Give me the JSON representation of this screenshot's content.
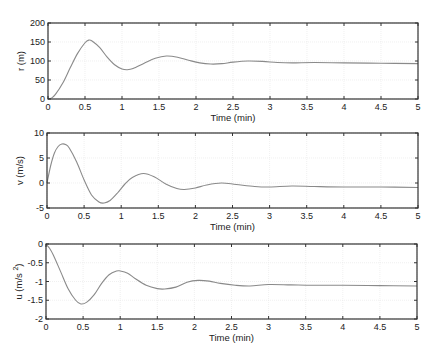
{
  "chart_data": [
    {
      "type": "line",
      "title": "",
      "xlabel": "Time (min)",
      "ylabel": "r (m)",
      "xlim": [
        0,
        5
      ],
      "ylim": [
        0,
        200
      ],
      "xticks": [
        "0",
        "0.5",
        "1",
        "1.5",
        "2",
        "2.5",
        "3",
        "3.5",
        "4",
        "4.5",
        "5"
      ],
      "yticks": [
        "0",
        "50",
        "100",
        "150",
        "200"
      ],
      "grid": true,
      "box": {
        "left": 48,
        "top": 23,
        "right": 418,
        "bottom": 99
      },
      "x": [
        0,
        0.05,
        0.1,
        0.2,
        0.3,
        0.4,
        0.5,
        0.55,
        0.6,
        0.7,
        0.8,
        0.9,
        1.0,
        1.07,
        1.15,
        1.3,
        1.45,
        1.6,
        1.75,
        1.9,
        2.05,
        2.2,
        2.35,
        2.5,
        2.7,
        2.9,
        3.1,
        3.3,
        3.6,
        4.0,
        4.5,
        5.0
      ],
      "series": [
        {
          "name": "r",
          "values": [
            0,
            3,
            12,
            42,
            82,
            120,
            148,
            155,
            152,
            135,
            110,
            90,
            79,
            77,
            80,
            94,
            107,
            113,
            110,
            102,
            95,
            92,
            93,
            97,
            100,
            99,
            96,
            95,
            96,
            95,
            94,
            93
          ]
        }
      ]
    },
    {
      "type": "line",
      "title": "",
      "xlabel": "Time (min)",
      "ylabel": "v (m/s)",
      "xlim": [
        0,
        5
      ],
      "ylim": [
        -5,
        10
      ],
      "xticks": [
        "0",
        "0.5",
        "1",
        "1.5",
        "2",
        "2.5",
        "3",
        "3.5",
        "4",
        "4.5",
        "5"
      ],
      "yticks": [
        "-5",
        "0",
        "5",
        "10"
      ],
      "grid": true,
      "box": {
        "left": 47,
        "top": 133,
        "right": 418,
        "bottom": 208
      },
      "x": [
        0,
        0.05,
        0.1,
        0.15,
        0.2,
        0.25,
        0.3,
        0.4,
        0.5,
        0.6,
        0.7,
        0.77,
        0.85,
        0.95,
        1.05,
        1.15,
        1.3,
        1.45,
        1.6,
        1.75,
        1.85,
        2.0,
        2.15,
        2.35,
        2.55,
        2.8,
        3.0,
        3.3,
        3.6,
        4.0,
        4.5,
        5.0
      ],
      "series": [
        {
          "name": "v",
          "values": [
            0,
            3.5,
            6,
            7.3,
            7.8,
            7.7,
            7.0,
            4.2,
            0.6,
            -2.4,
            -3.8,
            -4.0,
            -3.5,
            -2.0,
            -0.2,
            1.1,
            1.9,
            1.2,
            -0.2,
            -1.1,
            -1.3,
            -1.0,
            -0.4,
            0.0,
            -0.3,
            -0.7,
            -0.8,
            -0.6,
            -0.7,
            -0.8,
            -0.8,
            -0.9
          ]
        }
      ]
    },
    {
      "type": "line",
      "title": "",
      "xlabel": "Time (min)",
      "ylabel": "u (m/s²)",
      "xlim": [
        0,
        5
      ],
      "ylim": [
        -2,
        0
      ],
      "xticks": [
        "0",
        "0.5",
        "1",
        "1.5",
        "2",
        "2.5",
        "3",
        "3.5",
        "4",
        "4.5",
        "5"
      ],
      "yticks": [
        "-2",
        "-1.5",
        "-1",
        "-0.5",
        "0"
      ],
      "grid": true,
      "box": {
        "left": 46,
        "top": 244,
        "right": 417,
        "bottom": 319
      },
      "x": [
        0,
        0.05,
        0.1,
        0.2,
        0.3,
        0.4,
        0.47,
        0.55,
        0.65,
        0.75,
        0.85,
        0.95,
        1.0,
        1.1,
        1.2,
        1.35,
        1.5,
        1.6,
        1.75,
        1.9,
        2.05,
        2.2,
        2.35,
        2.55,
        2.75,
        3.0,
        3.3,
        3.6,
        4.0,
        4.5,
        5.0
      ],
      "series": [
        {
          "name": "u",
          "values": [
            0,
            -0.12,
            -0.3,
            -0.75,
            -1.2,
            -1.5,
            -1.6,
            -1.55,
            -1.35,
            -1.05,
            -0.82,
            -0.72,
            -0.72,
            -0.78,
            -0.92,
            -1.1,
            -1.19,
            -1.2,
            -1.15,
            -1.02,
            -0.97,
            -0.99,
            -1.05,
            -1.1,
            -1.12,
            -1.08,
            -1.09,
            -1.1,
            -1.1,
            -1.11,
            -1.12
          ]
        }
      ]
    }
  ],
  "plots": [
    {
      "ylabel_main": "r (m)",
      "ylabel_sup": "",
      "xlabel": "Time (min)"
    },
    {
      "ylabel_main": "v (m/s)",
      "ylabel_sup": "",
      "xlabel": "Time (min)"
    },
    {
      "ylabel_main": "u (m/s ",
      "ylabel_sup": "2",
      "ylabel_tail": ")",
      "xlabel": "Time (min)"
    }
  ],
  "colors": {
    "line": "#8a8a8a",
    "axis": "#333333",
    "grid": "#e6e6e6",
    "background": "#ffffff"
  }
}
